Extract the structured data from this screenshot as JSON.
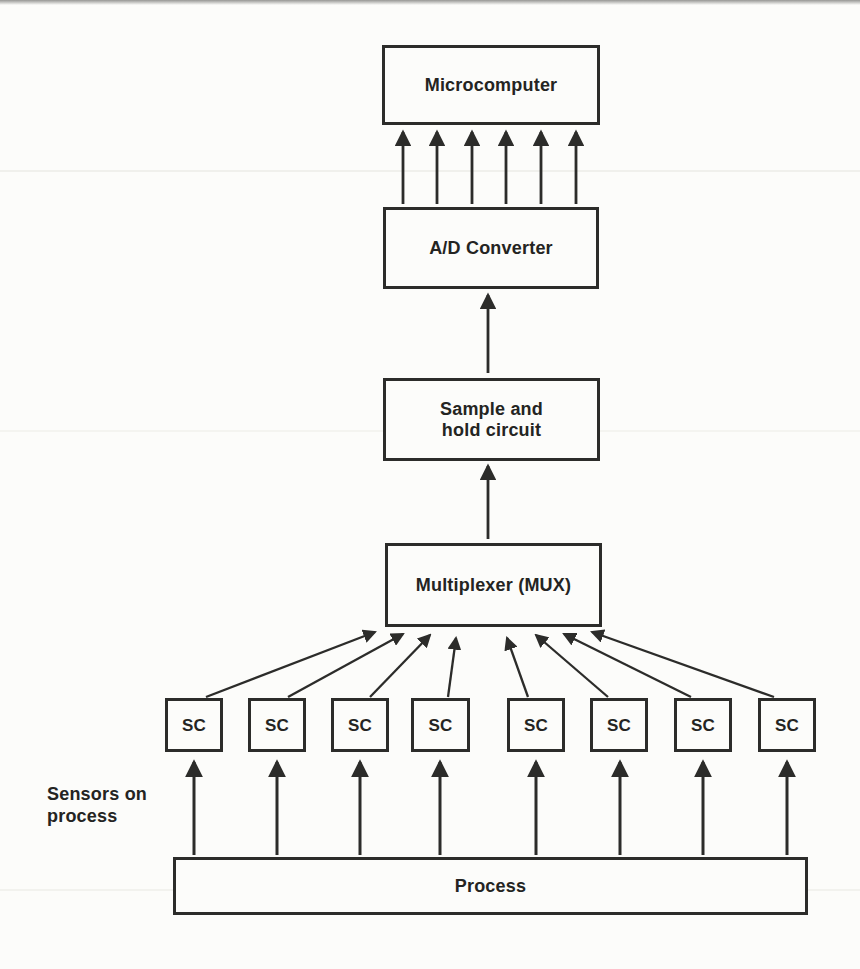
{
  "diagram": {
    "type": "block-flow-diagram",
    "nodes": {
      "microcomputer": {
        "label": "Microcomputer"
      },
      "adc": {
        "label": "A/D Converter"
      },
      "sample_hold": {
        "label": [
          "Sample and",
          "hold circuit"
        ]
      },
      "mux": {
        "label": "Multiplexer (MUX)"
      },
      "process": {
        "label": "Process"
      }
    },
    "sc_boxes": [
      {
        "label": "SC"
      },
      {
        "label": "SC"
      },
      {
        "label": "SC"
      },
      {
        "label": "SC"
      },
      {
        "label": "SC"
      },
      {
        "label": "SC"
      },
      {
        "label": "SC"
      },
      {
        "label": "SC"
      }
    ],
    "annotation": {
      "line1": "Sensors on",
      "line2": "process"
    },
    "edges": [
      {
        "from": "adc",
        "to": "microcomputer",
        "arrows": 6,
        "style": "parallel vertical bus"
      },
      {
        "from": "sample_hold",
        "to": "adc",
        "arrows": 1,
        "style": "vertical"
      },
      {
        "from": "mux",
        "to": "sample_hold",
        "arrows": 1,
        "style": "vertical"
      },
      {
        "from": "sc_boxes (each of 8)",
        "to": "mux",
        "arrows": 8,
        "style": "converging diagonals"
      },
      {
        "from": "process",
        "to": "sc_boxes (each of 8)",
        "arrows": 8,
        "style": "parallel vertical"
      }
    ],
    "colors": {
      "ink": "#2c2c2a",
      "paper": "#fcfcfa"
    }
  }
}
